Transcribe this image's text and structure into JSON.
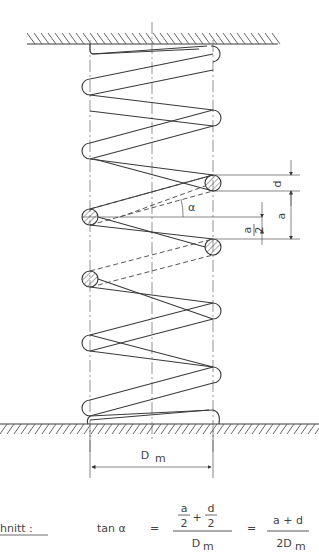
{
  "diagram": {
    "labels": {
      "alpha": "α",
      "d": "d",
      "a": "a",
      "a_half_num": "a",
      "a_half_den": "2",
      "dm": "D",
      "dm_sub": "m"
    },
    "caption": {
      "section_label": "hnitt :",
      "lhs": "tan α",
      "eq1": "=",
      "frac1_num_a": "a",
      "frac1_num_a_den": "2",
      "plus": "+",
      "frac1_num_d": "d",
      "frac1_num_d_den": "2",
      "frac1_den": "D",
      "frac1_den_sub": "m",
      "eq2": "=",
      "frac2_num": "a + d",
      "frac2_den": "2D",
      "frac2_den_sub": "m"
    },
    "colors": {
      "line": "#3a3a3a",
      "background": "#ffffff"
    }
  }
}
